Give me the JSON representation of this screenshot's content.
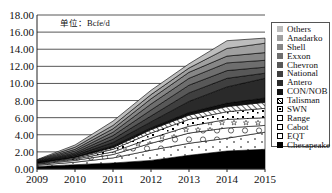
{
  "chart_data": {
    "type": "area",
    "stacked": true,
    "title": "",
    "unit_label": "单位：Bcfe/d",
    "xlabel": "",
    "ylabel": "",
    "x": [
      "2009",
      "2010",
      "2011",
      "2012",
      "2013",
      "2014",
      "2015"
    ],
    "ylim": [
      0,
      18
    ],
    "yticks": [
      "0.00",
      "2.00",
      "4.00",
      "6.00",
      "8.00",
      "10.00",
      "12.00",
      "14.00",
      "16.00",
      "18.00"
    ],
    "grid": true,
    "legend_position": "right",
    "series": [
      {
        "name": "Chesapeake",
        "color": "#000000",
        "pattern": "solid",
        "values": [
          0.3,
          0.5,
          0.7,
          1.0,
          1.6,
          2.1,
          2.3
        ]
      },
      {
        "name": "EQT",
        "color": "#ffffff",
        "pattern": "dots",
        "values": [
          0.15,
          0.3,
          0.6,
          1.2,
          1.4,
          1.5,
          2.0
        ]
      },
      {
        "name": "Cabot",
        "color": "#ffffff",
        "pattern": "circles",
        "values": [
          0.1,
          0.2,
          0.4,
          0.8,
          1.2,
          1.2,
          0.8
        ]
      },
      {
        "name": "Range",
        "color": "#ffffff",
        "pattern": "stars",
        "values": [
          0.07,
          0.15,
          0.3,
          0.6,
          0.8,
          1.0,
          0.9
        ]
      },
      {
        "name": "SWN",
        "color": "#ffffff",
        "pattern": "dot-squares",
        "values": [
          0.06,
          0.1,
          0.3,
          0.6,
          0.8,
          0.9,
          1.1
        ]
      },
      {
        "name": "Talisman",
        "color": "#ffffff",
        "pattern": "hatch",
        "values": [
          0.04,
          0.1,
          0.2,
          0.4,
          0.5,
          0.6,
          0.7
        ]
      },
      {
        "name": "CON/NOB",
        "color": "#111111",
        "pattern": "solid",
        "values": [
          0.03,
          0.1,
          0.2,
          0.2,
          0.3,
          0.4,
          0.5
        ]
      },
      {
        "name": "Antero",
        "color": "#2a2a2a",
        "pattern": "solid",
        "values": [
          0.05,
          0.15,
          0.4,
          0.7,
          1.3,
          1.9,
          2.3
        ]
      },
      {
        "name": "National",
        "color": "#3f3f3f",
        "pattern": "solid",
        "values": [
          0.05,
          0.15,
          0.4,
          0.7,
          1.0,
          1.0,
          0.6
        ]
      },
      {
        "name": "Chevron",
        "color": "#585858",
        "pattern": "solid",
        "values": [
          0.05,
          0.15,
          0.4,
          0.7,
          0.9,
          0.9,
          0.7
        ]
      },
      {
        "name": "Exxon",
        "color": "#6e6e6e",
        "pattern": "solid",
        "values": [
          0.05,
          0.2,
          0.4,
          0.7,
          0.8,
          0.9,
          0.8
        ]
      },
      {
        "name": "Shell",
        "color": "#868686",
        "pattern": "solid",
        "values": [
          0.05,
          0.2,
          0.4,
          0.6,
          0.7,
          0.8,
          0.9
        ]
      },
      {
        "name": "Anadarko",
        "color": "#a0a0a0",
        "pattern": "solid",
        "values": [
          0.05,
          0.25,
          0.4,
          0.5,
          0.5,
          0.9,
          1.1
        ]
      },
      {
        "name": "Others",
        "color": "#bdbdbd",
        "pattern": "solid",
        "values": [
          0.05,
          0.25,
          0.5,
          0.5,
          0.5,
          0.9,
          0.6
        ]
      }
    ]
  },
  "legend_order": [
    "Others",
    "Anadarko",
    "Shell",
    "Exxon",
    "Chevron",
    "National",
    "Antero",
    "CON/NOB",
    "Talisman",
    "SWN",
    "Range",
    "Cabot",
    "EQT",
    "Chesapeake"
  ]
}
